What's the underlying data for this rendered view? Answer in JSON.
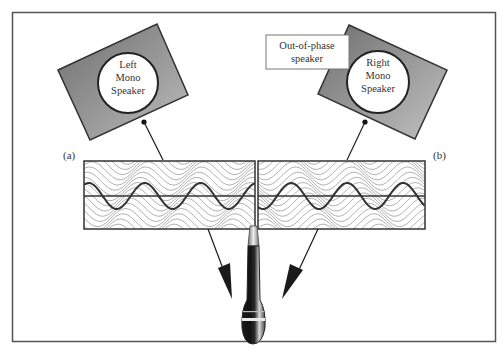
{
  "figure": {
    "frame_color": "#555555",
    "speaker_fill_dark": "#7a7a7a",
    "speaker_fill_light": "#b5b5b5",
    "wave_thin_color": "#8a8a8a",
    "wave_thick_color": "#3a3a3a"
  },
  "left_speaker": {
    "line1": "Left",
    "line2": "Mono",
    "line3": "Speaker"
  },
  "right_speaker": {
    "line1": "Right",
    "line2": "Mono",
    "line3": "Speaker"
  },
  "callout": {
    "line1": "Out-of-phase",
    "line2": "speaker"
  },
  "panel_labels": {
    "left": "(a)",
    "right": "(b)"
  },
  "microphone": {
    "icon": "microphone-icon"
  }
}
